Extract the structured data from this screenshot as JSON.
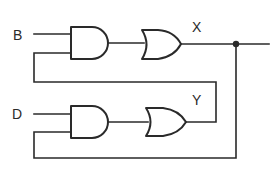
{
  "diagram": {
    "type": "logic-circuit",
    "inputs": [
      {
        "label": "B"
      },
      {
        "label": "D"
      }
    ],
    "outputs": [
      {
        "label": "X"
      },
      {
        "label": "Y"
      }
    ],
    "gates": [
      {
        "id": "and1",
        "type": "AND",
        "inputs": [
          "B",
          "Y"
        ]
      },
      {
        "id": "or1",
        "type": "OR",
        "inputs": [
          "and1"
        ],
        "output": "X"
      },
      {
        "id": "and2",
        "type": "AND",
        "inputs": [
          "D",
          "X"
        ]
      },
      {
        "id": "or2",
        "type": "OR",
        "inputs": [
          "and2"
        ],
        "output": "Y"
      }
    ],
    "junctions": [
      {
        "net": "X"
      }
    ],
    "colors": {
      "line": "#2a2a2a",
      "background": "#ffffff"
    }
  }
}
